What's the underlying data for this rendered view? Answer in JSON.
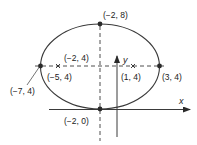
{
  "diagram": {
    "type": "ellipse",
    "colors": {
      "stroke": "#3a3a3a",
      "point": "#2a2a2a",
      "text": "#222222",
      "background": "#ffffff"
    },
    "axes": {
      "x_label": "x",
      "y_label": "y"
    },
    "center": {
      "label": "(−2, 4)"
    },
    "vertices": [
      {
        "name": "left-vertex",
        "label": "(−7, 4)"
      },
      {
        "name": "right-vertex",
        "label": "(3, 4)"
      }
    ],
    "covertices": [
      {
        "name": "top-covertex",
        "label": "(−2, 8)"
      },
      {
        "name": "bottom-covertex",
        "label": "(−2, 0)"
      }
    ],
    "foci": [
      {
        "name": "left-focus",
        "label": "(−5, 4)"
      },
      {
        "name": "right-focus",
        "label": "(1, 4)"
      }
    ]
  }
}
